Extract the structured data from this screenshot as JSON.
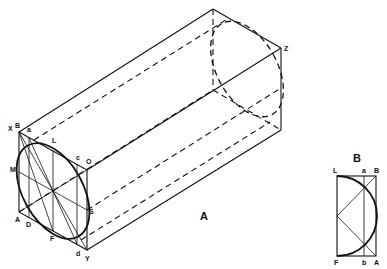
{
  "figure": {
    "type": "isometric-construction-drawing",
    "figure_a": {
      "caption": "A",
      "points": {
        "X": "X",
        "B": "B",
        "a": "a",
        "L": "L",
        "c": "c",
        "O": "O",
        "M": "M",
        "S": "S",
        "A": "A",
        "D": "D",
        "F": "F",
        "d": "d",
        "Y": "Y",
        "Z": "Z"
      }
    },
    "figure_b": {
      "caption": "B",
      "points": {
        "L": "L",
        "a": "a",
        "B": "B",
        "F": "F",
        "b": "b",
        "A": "A"
      }
    }
  }
}
